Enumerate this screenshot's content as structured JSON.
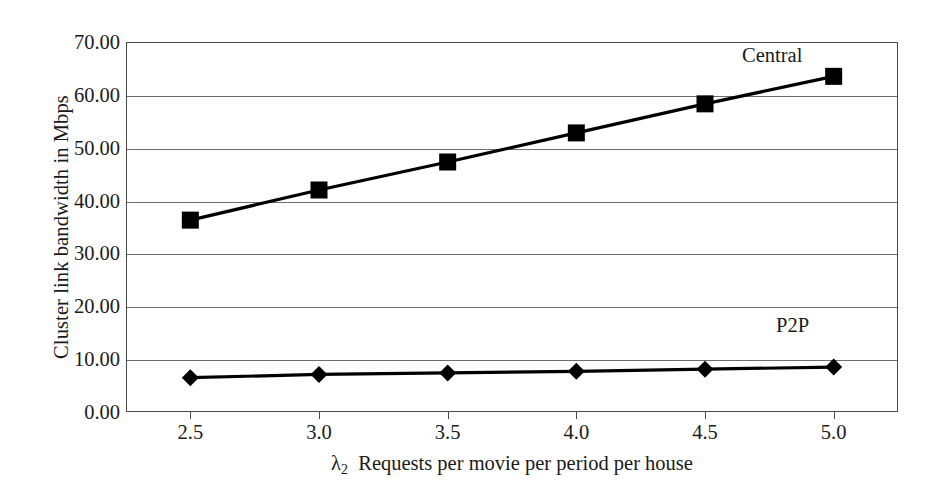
{
  "chart_data": {
    "type": "line",
    "title": "",
    "subtitle": "",
    "xlabel": "λ2  Requests per movie per period per house",
    "xlabel_symbol": "λ",
    "xlabel_subscript": "2",
    "xlabel_rest": "Requests per movie per period per house",
    "ylabel": "Cluster link bandwidth in Mbps",
    "x": [
      2.5,
      3.0,
      3.5,
      4.0,
      4.5,
      5.0
    ],
    "xticklabels": [
      "2.5",
      "3.0",
      "3.5",
      "4.0",
      "4.5",
      "5.0"
    ],
    "yticklabels": [
      "0.00",
      "10.00",
      "20.00",
      "30.00",
      "40.00",
      "50.00",
      "60.00",
      "70.00"
    ],
    "yticks": [
      0,
      10,
      20,
      30,
      40,
      50,
      60,
      70
    ],
    "xlim": [
      2.25,
      5.25
    ],
    "ylim": [
      0,
      70
    ],
    "grid": "horizontal",
    "legend_position": "inline-annotation",
    "series": [
      {
        "name": "Central",
        "marker": "square",
        "color": "#000000",
        "values": [
          36.3,
          42.0,
          47.3,
          52.8,
          58.3,
          63.5
        ]
      },
      {
        "name": "P2P",
        "marker": "diamond",
        "color": "#000000",
        "values": [
          6.5,
          7.1,
          7.4,
          7.7,
          8.1,
          8.5
        ]
      }
    ],
    "annotations": [
      {
        "text": "Central",
        "series": "Central"
      },
      {
        "text": "P2P",
        "series": "P2P"
      }
    ]
  },
  "style": {
    "frame_color": "#4a4a4a",
    "grid_color": "#6e6e6e",
    "line_color": "#000000",
    "background": "#ffffff",
    "text_color": "#1a1a1a"
  }
}
